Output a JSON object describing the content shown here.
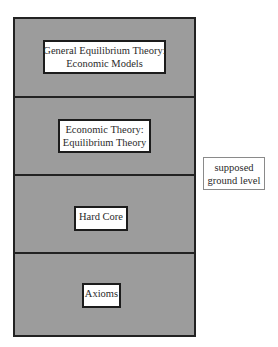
{
  "diagram": {
    "colors": {
      "layer_fill": "#9c9c9c",
      "border": "#222222",
      "label_fill": "#ffffff",
      "side_label_border": "#8a8a8a"
    },
    "layers": [
      {
        "line1": "General Equilibrium Theory:",
        "line2": "Economic Models"
      },
      {
        "line1": "Economic Theory:",
        "line2": "Equilibrium Theory"
      },
      {
        "line1": "Hard Core"
      },
      {
        "line1": "Axioms"
      }
    ],
    "side_label": {
      "line1": "supposed",
      "line2": "ground level"
    }
  }
}
